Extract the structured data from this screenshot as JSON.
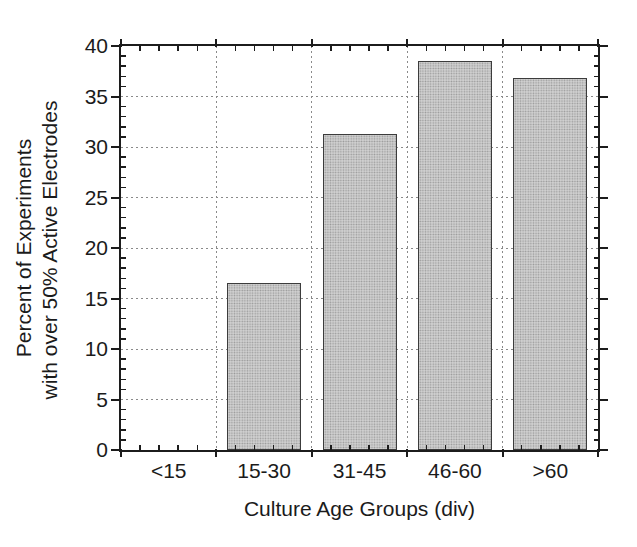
{
  "chart_data": {
    "type": "bar",
    "title": "",
    "xlabel": "Culture Age Groups (div)",
    "ylabel": "Percent of Experiments with over 50% Active Electrodes",
    "ylabel_lines": [
      "Percent of Experiments",
      "with over 50% Active Electrodes"
    ],
    "categories": [
      "<15",
      "15-30",
      "31-45",
      "46-60",
      ">60"
    ],
    "values": [
      0,
      16.5,
      31.3,
      38.5,
      36.8
    ],
    "ylim": [
      0,
      40
    ],
    "ytick_major": 5,
    "ytick_minor": 1,
    "ytick_labels": [
      "0",
      "5",
      "10",
      "15",
      "20",
      "25",
      "30",
      "35",
      "40"
    ],
    "x_minor_divisions_per_category": 5,
    "grid": {
      "horizontal": "dashed line at every major y tick (5 to 35)",
      "vertical": "dashed line at each category boundary",
      "color": "#8a8a8a"
    },
    "legend": "none",
    "bar_fill_color": "#cfcfcf",
    "bar_fill_texture": "stipple-dots",
    "bar_edge_color": "#3c3c3c",
    "axis_color": "#1c1c1c",
    "background_color": "#ffffff"
  }
}
